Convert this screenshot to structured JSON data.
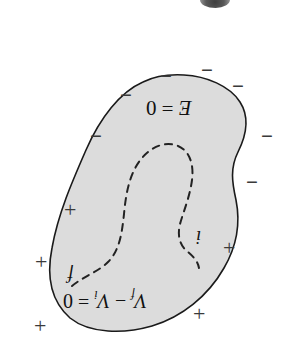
{
  "figure": {
    "name": "charged-conductor-equipotential-diagram",
    "width": 284,
    "height": 338,
    "background_color": "#ffffff",
    "conductor": {
      "fill_color": "#dcdcdc",
      "stroke_color": "#1a1a1a",
      "stroke_width": 1.6,
      "outline_path": "M 143 82 C 120 92 100 118 86 150 C 72 182 58 214 52 248 C 46 278 52 302 70 318 C 90 334 124 334 152 326 C 182 317 208 296 224 268 C 238 244 240 220 236 200 C 232 182 230 168 238 152 C 247 134 249 116 240 102 C 230 86 206 76 184 75 C 166 74 153 77 143 82 Z"
    },
    "field_path": {
      "name": "dashed-path-i-to-f",
      "stroke_color": "#222222",
      "stroke_width": 2.0,
      "dash_pattern": "7 6",
      "path": "M 72 286 C 84 276 98 272 108 262 C 120 250 122 232 124 214 C 126 192 130 172 142 158 C 152 146 166 141 178 146 C 190 151 194 165 192 180 C 190 196 184 210 180 224 C 177 236 180 246 188 252 C 194 257 198 262 199 268"
    },
    "surface_charges": {
      "negative_label": "−",
      "negative_color": "#3a3a3a",
      "negative_positions": [
        {
          "x": 160,
          "y": 66
        },
        {
          "x": 201,
          "y": 60
        },
        {
          "x": 232,
          "y": 76
        },
        {
          "x": 120,
          "y": 85
        },
        {
          "x": 90,
          "y": 126
        },
        {
          "x": 261,
          "y": 126
        },
        {
          "x": 246,
          "y": 172
        }
      ],
      "positive_label": "+",
      "positive_color": "#3a3a3a",
      "positive_positions": [
        {
          "x": 64,
          "y": 199
        },
        {
          "x": 35,
          "y": 251
        },
        {
          "x": 34,
          "y": 315
        },
        {
          "x": 223,
          "y": 237
        },
        {
          "x": 193,
          "y": 303
        }
      ]
    },
    "annotations": {
      "efield_text": "E = 0",
      "efield_italic_symbol": "E",
      "efield_rest": " = 0",
      "potential_symbol_f": "V",
      "potential_sub_f": "f",
      "potential_minus": " − ",
      "potential_symbol_i": "V",
      "potential_sub_i": "i",
      "potential_equals": " = 0",
      "potential_full_text": "V_f − V_i = 0",
      "point_f_label": "f",
      "point_i_label": "i",
      "orientation_note": "rotated-180-degrees"
    },
    "top_artifact": {
      "name": "page-scan-smudge",
      "color": "#3a3a3a"
    }
  }
}
